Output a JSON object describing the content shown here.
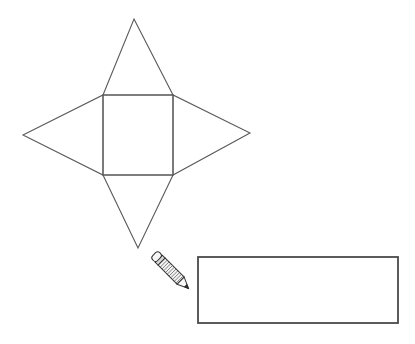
{
  "page": {
    "background_color": "#ffffff",
    "width": 415,
    "height": 344
  },
  "figure": {
    "title": "",
    "stroke_color": "#5a5a5a",
    "stroke_width": 1.1,
    "fill_color": "none",
    "net_shape": {
      "name": "square-pyramid-net",
      "description": "Net of a square pyramid: a central square with four congruent triangles attached to each side",
      "square": {
        "name": "base-square",
        "top_left": [
          103,
          95
        ],
        "top_right": [
          173,
          95
        ],
        "bottom_right": [
          173,
          175
        ],
        "bottom_left": [
          103,
          175
        ]
      },
      "triangles": [
        {
          "name": "top-triangle",
          "apex": [
            134,
            19
          ],
          "base": [
            [
              103,
              95
            ],
            [
              173,
              95
            ]
          ]
        },
        {
          "name": "right-triangle",
          "apex": [
            250,
            133
          ],
          "base": [
            [
              173,
              95
            ],
            [
              173,
              175
            ]
          ]
        },
        {
          "name": "bottom-triangle",
          "apex": [
            138,
            248
          ],
          "base": [
            [
              103,
              175
            ],
            [
              173,
              175
            ]
          ]
        },
        {
          "name": "left-triangle",
          "apex": [
            23,
            135
          ],
          "base": [
            [
              103,
              95
            ],
            [
              103,
              175
            ]
          ]
        }
      ]
    },
    "answer_box": {
      "name": "answer-rectangle",
      "x": 198,
      "y": 257,
      "width": 200,
      "height": 66,
      "stroke_color": "#4a4a4a",
      "stroke_width": 1.8,
      "fill_color": "#ffffff",
      "value": ""
    },
    "pencil_icon": {
      "name": "pencil-icon",
      "tip": [
        189,
        289
      ],
      "eraser": [
        161,
        261
      ],
      "body_color": "#f2f2f2",
      "outline_color": "#3a3a3a",
      "ferrule_color": "#d8d8d8",
      "lead_color": "#2b2b2b"
    }
  }
}
